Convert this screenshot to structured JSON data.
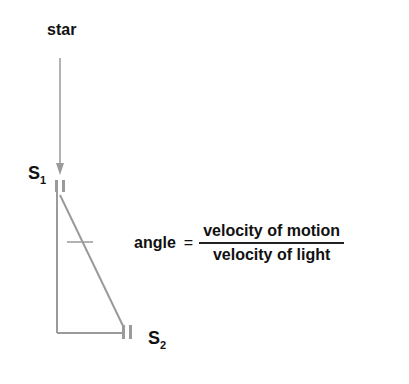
{
  "diagram": {
    "labels": {
      "star": "star",
      "s1_main": "S",
      "s1_sub": "1",
      "s2_main": "S",
      "s2_sub": "2"
    },
    "formula": {
      "lhs": "angle",
      "equals": "=",
      "numerator": "velocity of motion",
      "denominator": "velocity of light"
    },
    "colors": {
      "line": "#9a9a9a",
      "text": "#111111"
    }
  }
}
